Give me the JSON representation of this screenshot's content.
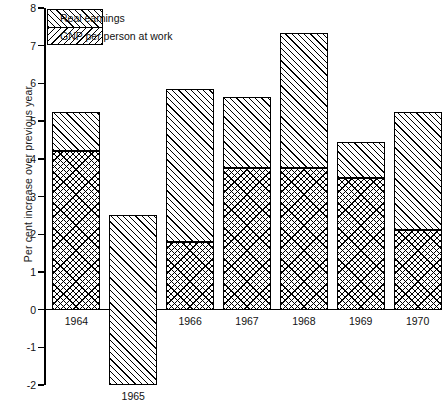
{
  "chart_data": {
    "type": "bar",
    "title": "",
    "subtitle": "",
    "xlabel": "",
    "ylabel": "Per cent increase over previous year",
    "categories": [
      "1964",
      "1965",
      "1966",
      "1967",
      "1968",
      "1969",
      "1970"
    ],
    "series": [
      {
        "name": "GNP per person at work",
        "pattern": "cross-hatch",
        "values": [
          4.2,
          0,
          1.8,
          3.75,
          3.75,
          3.5,
          2.1
        ]
      },
      {
        "name": "Real earnings",
        "pattern": "forward-diagonal-hatch",
        "values": [
          1.05,
          4.5,
          4.05,
          1.9,
          3.6,
          0.95,
          3.15
        ]
      }
    ],
    "totals": [
      5.25,
      2.5,
      5.85,
      5.65,
      7.35,
      4.45,
      5.25
    ],
    "bar_bases": [
      0,
      -2.0,
      0,
      0,
      0,
      0,
      0
    ],
    "stacked": true,
    "ylim": [
      -2,
      8
    ],
    "yticks": [
      -2,
      -1,
      0,
      1,
      2,
      3,
      4,
      5,
      6,
      7,
      8
    ],
    "ytick_labels": [
      "-2",
      "-1",
      "0",
      "1",
      "2",
      "3",
      "4",
      "5",
      "6",
      "7",
      "8"
    ],
    "grid": false,
    "legend_position": "top-left"
  },
  "legend": {
    "entries": [
      {
        "label": "Real earnings",
        "pattern": "forward-diagonal-hatch"
      },
      {
        "label": "GNP per person at work",
        "pattern": "backward-diagonal-hatch"
      }
    ]
  },
  "axes": {
    "y_label": "Per cent increase over previous year",
    "y_ticks": [
      "8",
      "7",
      "6",
      "5",
      "4",
      "3",
      "2",
      "1",
      "0",
      "-1",
      "-2"
    ],
    "x_ticks": [
      "1964",
      "1965",
      "1966",
      "1967",
      "1968",
      "1969",
      "1970"
    ]
  }
}
